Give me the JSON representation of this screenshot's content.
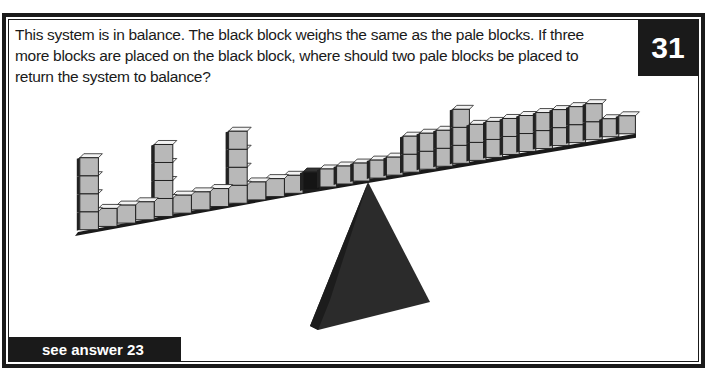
{
  "puzzle": {
    "number": "31",
    "question": "This system is in balance. The black block weighs the same as the pale blocks. If three more blocks are placed on the black block, where should two pale blocks be placed to return the system to balance?",
    "answer_link": "see answer 23"
  },
  "diagram": {
    "left_side_stack_heights_from_center": [
      1,
      1,
      1,
      4,
      1,
      1,
      1,
      4,
      1,
      1,
      1,
      4
    ],
    "center_block": "black",
    "right_side_stack_heights_from_center": [
      1,
      1,
      1,
      1,
      1,
      2,
      2,
      2,
      3,
      2,
      2,
      2,
      2,
      2,
      2,
      2,
      2,
      1,
      1
    ],
    "colors": {
      "pale_block_face": "#b8b8b8",
      "pale_block_top": "#f2f2f2",
      "black_block": "#151515",
      "fulcrum": "#2b2b2b",
      "frame": "#1a1a1a"
    }
  }
}
